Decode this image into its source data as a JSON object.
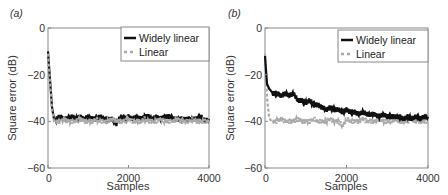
{
  "chart_data": [
    {
      "panel_label": "(a)",
      "type": "line",
      "title": "",
      "xlabel": "Samples",
      "ylabel": "Square error (dB)",
      "xlim": [
        0,
        4000
      ],
      "ylim": [
        -60,
        0
      ],
      "xticks": [
        0,
        2000,
        4000
      ],
      "yticks": [
        0,
        -20,
        -40,
        -60
      ],
      "xtick_labels": [
        "0",
        "2000",
        "4000"
      ],
      "ytick_labels": [
        "0",
        "−20",
        "−40",
        "−60"
      ],
      "grid": false,
      "legend_position": "upper right",
      "series": [
        {
          "name": "Widely linear",
          "style": "solid",
          "color": "#111111",
          "x": [
            0,
            50,
            100,
            150,
            200,
            300,
            400,
            500,
            600,
            700,
            800,
            900,
            1000,
            1100,
            1200,
            1300,
            1400,
            1500,
            1600,
            1700,
            1800,
            1900,
            2000,
            2100,
            2200,
            2300,
            2400,
            2500,
            2600,
            2700,
            2800,
            2900,
            3000,
            3100,
            3200,
            3300,
            3400,
            3500,
            3600,
            3700,
            3800,
            3900,
            4000
          ],
          "values": [
            -10,
            -22,
            -34,
            -39,
            -39,
            -38,
            -39,
            -39,
            -38,
            -39,
            -38,
            -39,
            -38,
            -39,
            -39,
            -38,
            -39,
            -39,
            -39,
            -41,
            -38,
            -39,
            -38,
            -39,
            -38,
            -39,
            -38,
            -38,
            -39,
            -38,
            -39,
            -38,
            -38,
            -39,
            -39,
            -39,
            -39,
            -39,
            -39,
            -39,
            -38,
            -40,
            -39
          ]
        },
        {
          "name": "Linear",
          "style": "dashed",
          "color": "#aaaaaa",
          "x": [
            0,
            50,
            100,
            150,
            200,
            300,
            400,
            500,
            600,
            700,
            800,
            900,
            1000,
            1100,
            1200,
            1300,
            1400,
            1500,
            1600,
            1700,
            1800,
            1900,
            2000,
            2100,
            2200,
            2300,
            2400,
            2500,
            2600,
            2700,
            2800,
            2900,
            3000,
            3100,
            3200,
            3300,
            3400,
            3500,
            3600,
            3700,
            3800,
            3900,
            4000
          ],
          "values": [
            -11,
            -23,
            -35,
            -40,
            -40,
            -40,
            -39,
            -40,
            -40,
            -40,
            -39,
            -40,
            -40,
            -40,
            -39,
            -40,
            -40,
            -40,
            -39,
            -40,
            -40,
            -40,
            -39,
            -40,
            -40,
            -40,
            -39,
            -40,
            -40,
            -40,
            -39,
            -40,
            -40,
            -40,
            -39,
            -40,
            -40,
            -40,
            -39,
            -40,
            -40,
            -40,
            -40
          ]
        }
      ]
    },
    {
      "panel_label": "(b)",
      "type": "line",
      "title": "",
      "xlabel": "Samples",
      "ylabel": "Square error (dB)",
      "xlim": [
        0,
        4000
      ],
      "ylim": [
        -60,
        0
      ],
      "xticks": [
        0,
        2000,
        4000
      ],
      "yticks": [
        0,
        -20,
        -40,
        -60
      ],
      "xtick_labels": [
        "0",
        "2000",
        "4000"
      ],
      "ytick_labels": [
        "0",
        "−20",
        "−40",
        "−60"
      ],
      "grid": false,
      "legend_position": "upper right",
      "series": [
        {
          "name": "Widely linear",
          "style": "solid",
          "color": "#111111",
          "x": [
            0,
            50,
            100,
            150,
            200,
            300,
            400,
            500,
            600,
            700,
            800,
            900,
            1000,
            1100,
            1200,
            1300,
            1400,
            1500,
            1600,
            1700,
            1800,
            1900,
            2000,
            2100,
            2200,
            2300,
            2400,
            2500,
            2600,
            2700,
            2800,
            2900,
            3000,
            3100,
            3200,
            3300,
            3400,
            3500,
            3600,
            3700,
            3800,
            3900,
            4000
          ],
          "values": [
            -12,
            -24,
            -26,
            -27,
            -28,
            -28,
            -29,
            -28,
            -29,
            -28,
            -31,
            -31,
            -32,
            -31,
            -33,
            -33,
            -34,
            -35,
            -34,
            -35,
            -35,
            -36,
            -35,
            -36,
            -36,
            -37,
            -36,
            -37,
            -37,
            -37,
            -38,
            -37,
            -38,
            -38,
            -38,
            -38,
            -39,
            -38,
            -39,
            -38,
            -39,
            -38,
            -38
          ]
        },
        {
          "name": "Linear",
          "style": "dashed",
          "color": "#aaaaaa",
          "x": [
            0,
            50,
            100,
            150,
            200,
            300,
            400,
            500,
            600,
            700,
            800,
            900,
            1000,
            1100,
            1200,
            1300,
            1400,
            1500,
            1600,
            1700,
            1800,
            1900,
            2000,
            2100,
            2200,
            2300,
            2400,
            2500,
            2600,
            2700,
            2800,
            2900,
            3000,
            3100,
            3200,
            3300,
            3400,
            3500,
            3600,
            3700,
            3800,
            3900,
            4000
          ],
          "values": [
            -11,
            -30,
            -38,
            -40,
            -40,
            -40,
            -39,
            -40,
            -40,
            -40,
            -39,
            -40,
            -40,
            -40,
            -39,
            -40,
            -40,
            -40,
            -39,
            -40,
            -40,
            -42,
            -39,
            -40,
            -40,
            -40,
            -39,
            -40,
            -40,
            -40,
            -39,
            -40,
            -40,
            -40,
            -39,
            -40,
            -40,
            -40,
            -39,
            -40,
            -40,
            -40,
            -40
          ]
        }
      ]
    }
  ],
  "layout": {
    "panels": [
      {
        "plot": {
          "x0": 48,
          "x1": 209,
          "y0": 28,
          "y1": 168
        },
        "legend": {
          "x": 121,
          "y": 27,
          "w": 88,
          "h": 34
        },
        "label_pos": {
          "x": 10,
          "y": 17
        }
      },
      {
        "plot": {
          "x0": 265,
          "x1": 428,
          "y0": 28,
          "y1": 168
        },
        "legend": {
          "x": 338,
          "y": 30,
          "w": 90,
          "h": 32
        },
        "label_pos": {
          "x": 228,
          "y": 17
        }
      }
    ]
  }
}
